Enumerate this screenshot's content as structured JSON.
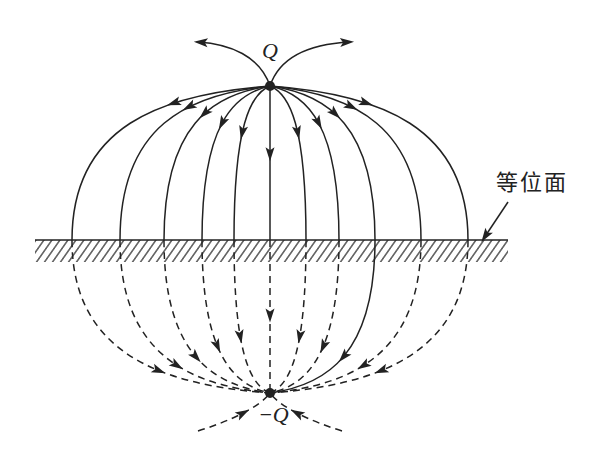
{
  "diagram": {
    "labels": {
      "top_charge": "Q",
      "image_charge": "−Q",
      "equipotential": "等位面"
    },
    "geometry": {
      "top_charge": [
        270,
        86
      ],
      "image_charge": [
        270,
        393
      ],
      "plane_y": 240,
      "plane_x": [
        35,
        508
      ],
      "plane_intersections_x": [
        72,
        120,
        164,
        202,
        234,
        270,
        306,
        339,
        375,
        421,
        468
      ]
    },
    "line_color": "#222222",
    "background": "#ffffff"
  }
}
